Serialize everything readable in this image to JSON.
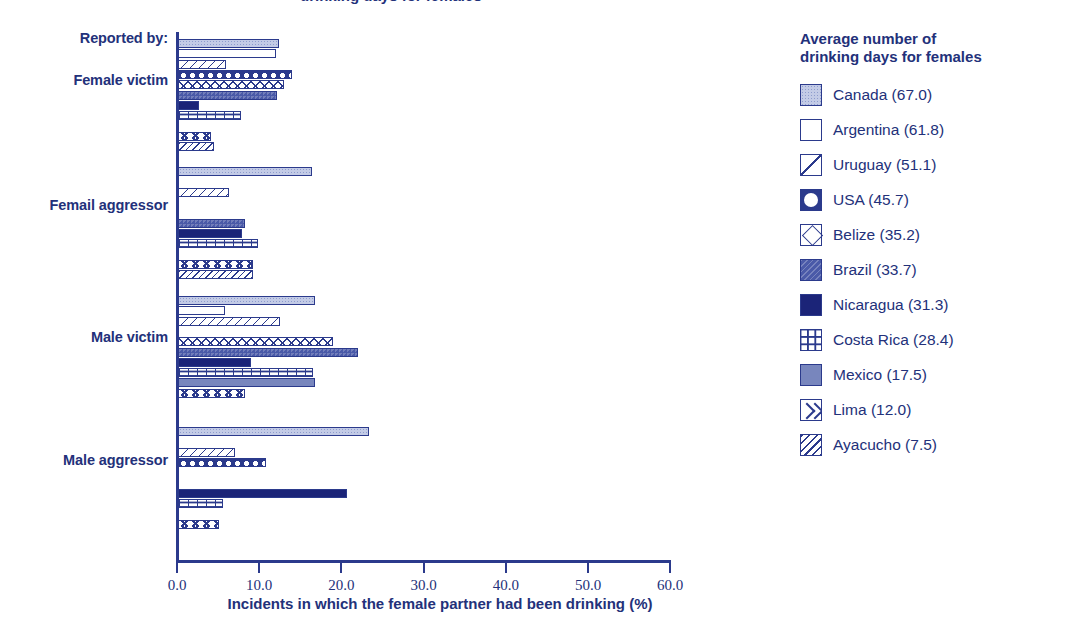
{
  "clipped_title": "drinking days for females",
  "axis": {
    "left_header": "Reported by:",
    "x_title": "Incidents in which the female partner had been drinking (%)",
    "x_ticks": [
      "0.0",
      "10.0",
      "20.0",
      "30.0",
      "40.0",
      "50.0",
      "60.0"
    ]
  },
  "legend": {
    "title": "Average number of\ndrinking days for females",
    "items": [
      {
        "label": "Canada (67.0)",
        "country": "Canada",
        "value": 67.0,
        "pattern": "stipple"
      },
      {
        "label": "Argentina (61.8)",
        "country": "Argentina",
        "value": 61.8,
        "pattern": "white"
      },
      {
        "label": "Uruguay (51.1)",
        "country": "Uruguay",
        "value": 51.1,
        "pattern": "diag"
      },
      {
        "label": "USA (45.7)",
        "country": "USA",
        "value": 45.7,
        "pattern": "circle"
      },
      {
        "label": "Belize (35.2)",
        "country": "Belize",
        "value": 35.2,
        "pattern": "diamond"
      },
      {
        "label": "Brazil (33.7)",
        "country": "Brazil",
        "value": 33.7,
        "pattern": "brazil"
      },
      {
        "label": "Nicaragua (31.3)",
        "country": "Nicaragua",
        "value": 31.3,
        "pattern": "solid"
      },
      {
        "label": "Costa Rica (28.4)",
        "country": "Costa Rica",
        "value": 28.4,
        "pattern": "grid"
      },
      {
        "label": "Mexico (17.5)",
        "country": "Mexico",
        "value": 17.5,
        "pattern": "mexico"
      },
      {
        "label": "Lima (12.0)",
        "country": "Lima",
        "value": 12.0,
        "pattern": "chevron"
      },
      {
        "label": "Ayacucho (7.5)",
        "country": "Ayacucho",
        "value": 7.5,
        "pattern": "hatch"
      }
    ]
  },
  "chart_data": {
    "type": "bar",
    "orientation": "horizontal",
    "title": "",
    "xlabel": "Incidents in which the female partner had been drinking (%)",
    "ylabel": "Reported by:",
    "xlim": [
      0.0,
      60.0
    ],
    "xticks": [
      0.0,
      10.0,
      20.0,
      30.0,
      40.0,
      50.0,
      60.0
    ],
    "grid": false,
    "legend_position": "right",
    "categories": [
      "Female victim",
      "Femail aggressor",
      "Male victim",
      "Male aggressor"
    ],
    "series": [
      {
        "name": "Canada",
        "values": [
          12.3,
          16.3,
          16.7,
          23.2
        ]
      },
      {
        "name": "Argentina",
        "values": [
          11.9,
          null,
          5.7,
          null
        ]
      },
      {
        "name": "Uruguay",
        "values": [
          5.8,
          6.2,
          12.4,
          6.9
        ]
      },
      {
        "name": "USA",
        "values": [
          13.9,
          null,
          null,
          10.7
        ]
      },
      {
        "name": "Belize",
        "values": [
          12.9,
          null,
          18.9,
          null
        ]
      },
      {
        "name": "Brazil",
        "values": [
          12.0,
          8.2,
          21.9,
          null
        ]
      },
      {
        "name": "Nicaragua",
        "values": [
          2.6,
          7.8,
          8.9,
          20.6
        ]
      },
      {
        "name": "Costa Rica",
        "values": [
          7.7,
          9.7,
          16.4,
          5.5
        ]
      },
      {
        "name": "Mexico",
        "values": [
          null,
          null,
          16.7,
          null
        ]
      },
      {
        "name": "Lima",
        "values": [
          4.0,
          9.1,
          8.2,
          5.0
        ]
      },
      {
        "name": "Ayacucho",
        "values": [
          4.4,
          9.1,
          null,
          null
        ]
      }
    ]
  }
}
